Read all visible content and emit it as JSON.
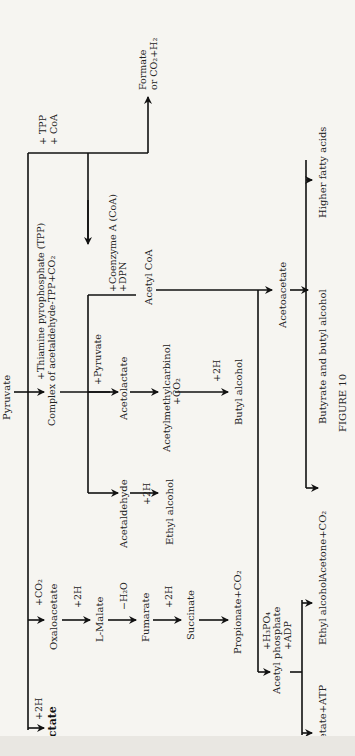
{
  "figure": {
    "caption": "FIGURE 10",
    "orientation": "rotated 90° counter-clockwise"
  },
  "nodes": {
    "pyruvate": "Pyruvate",
    "lactate": "Lactate",
    "lactate_reagent": "+2H",
    "complex": "Complex of acetaldehyde-TPP+CO₂",
    "complex_reagent": "+Thiamine pyrophosphate (TPP)",
    "acetaldehyde": "Acetaldehyde",
    "ethyl_alcohol_1": "Ethyl alcohol",
    "ethyl_alcohol_1_reagent": "+2H",
    "acetolactate": "Acetolactate",
    "acetolactate_reagent": "+Pyruvate",
    "acetylmethylcarbinol": "Acetylmethylcarbinol",
    "acetylmethylcarbinol_reagent": "+CO₂",
    "butyl_alcohol_top": "Butyl alcohol",
    "butyl_alcohol_reagent": "+2H",
    "acetyl_coa": "Acetyl CoA",
    "acetyl_coa_reagent_1": "+Coenzyme A (CoA)",
    "acetyl_coa_reagent_2": "+DPN",
    "tpp_coa_1": "+ TPP",
    "tpp_coa_2": "+ CoA",
    "formate_1": "Formate",
    "formate_2": "or CO₂+H₂",
    "acetoacetate": "Acetoacetate",
    "acetone": "Acetone+CO₂",
    "butyrate": "Butyrate and butyl alcohol",
    "higher_fatty_acids": "Higher fatty acids",
    "oxaloacetate": "Oxaloacetate",
    "oxaloacetate_reagent": "+CO₂",
    "malate": "L-Malate",
    "malate_reagent": "+2H",
    "fumarate": "Fumarate",
    "fumarate_reagent": "−H₂O",
    "succinate": "Succinate",
    "succinate_reagent": "+2H",
    "propionate": "Propionate+CO₂",
    "acetyl_phosphate": "Acetyl phosphate",
    "acetyl_phosphate_reagent_1": "+H₃PO₄",
    "acetyl_phosphate_reagent_2": "+ADP",
    "acetate_atp": "Acetate+ATP",
    "ethyl_alcohol_2": "Ethyl alcohol"
  }
}
